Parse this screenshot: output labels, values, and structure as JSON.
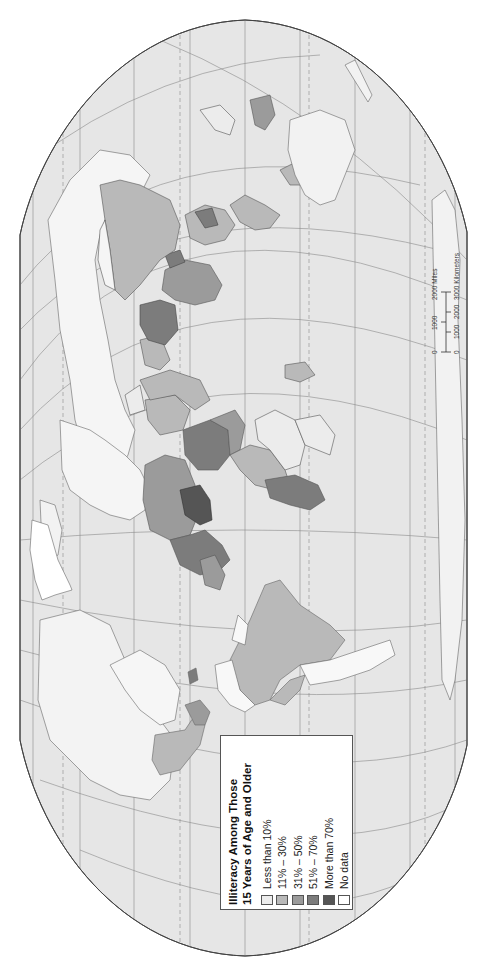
{
  "map": {
    "title_line1": "Illiteracy Among Those",
    "title_line2": "15 Years of Age and Older",
    "orientation": "rotated 90° counter-clockwise",
    "background_ocean": "#e4e4e4",
    "outline_color": "#444444"
  },
  "legend": {
    "title_line1": "Illiteracy Among Those",
    "title_line2": "15 Years of Age and Older",
    "items": [
      {
        "label": "Less than 10%",
        "color": "#ececec"
      },
      {
        "label": "11% – 30%",
        "color": "#b9b9b9"
      },
      {
        "label": "31% – 50%",
        "color": "#9b9b9b"
      },
      {
        "label": "51% – 70%",
        "color": "#7c7c7c"
      },
      {
        "label": "More than 70%",
        "color": "#555555"
      },
      {
        "label": "No data",
        "color": "#ffffff"
      }
    ]
  },
  "scale_bar": {
    "miles_ticks": [
      "0",
      "1000",
      "2000 Miles"
    ],
    "km_ticks": [
      "0",
      "1000",
      "2000",
      "3000 Kilometers"
    ]
  }
}
